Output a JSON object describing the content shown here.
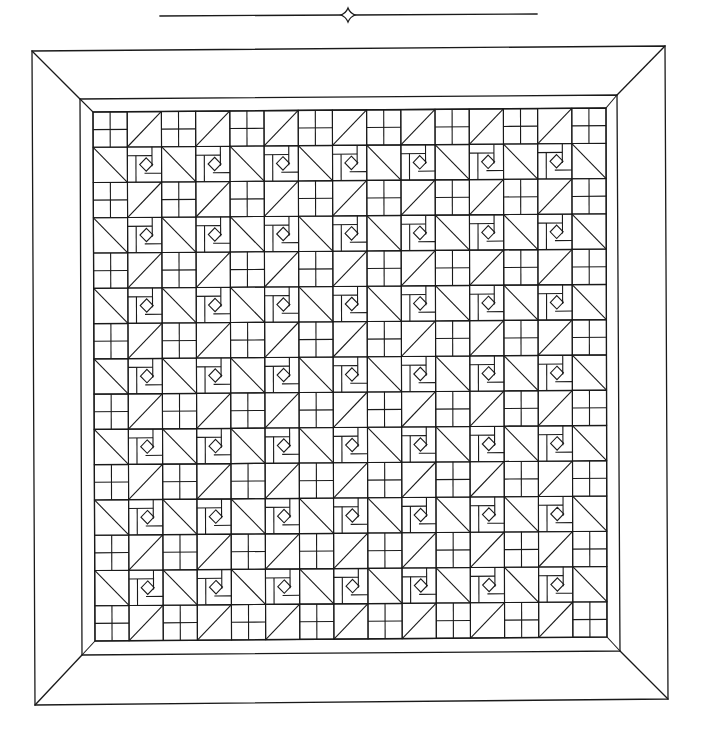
{
  "title": "Quilt pattern diagram",
  "ornament": {
    "line_left_x1": 160,
    "line_right_x2": 537,
    "y": 15,
    "star_center_x": 348,
    "star_center_y": 15
  },
  "frame": {
    "outer": {
      "tl": [
        32,
        51
      ],
      "tr": [
        665,
        46
      ],
      "br": [
        668,
        699
      ],
      "bl": [
        35,
        705
      ]
    },
    "inner_border": {
      "tl": [
        80,
        99
      ],
      "tr": [
        617,
        95
      ],
      "br": [
        620,
        651
      ],
      "bl": [
        82,
        655
      ]
    },
    "grid": {
      "tl": [
        93,
        112
      ],
      "tr": [
        606,
        108
      ],
      "br": [
        607,
        637
      ],
      "bl": [
        95,
        641
      ]
    }
  },
  "grid": {
    "rows": 15,
    "cols": 15,
    "pattern": {
      "even_row": [
        "four-patch",
        "hst-slash"
      ],
      "odd_row": [
        "hst-backslash",
        "spiral"
      ]
    }
  },
  "colors": {
    "line": "#1a1a1a",
    "background": "#ffffff"
  }
}
